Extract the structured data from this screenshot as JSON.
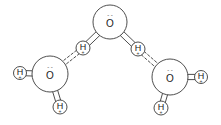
{
  "colors": {
    "stroke": "#3a3a3a",
    "fill": "#ffffff",
    "text": "#222222"
  },
  "atoms": [
    {
      "id": "O1",
      "element": "O",
      "label": "O",
      "charge_mark": "- -",
      "cx": 110,
      "cy": 22,
      "r": 17
    },
    {
      "id": "O2",
      "element": "O",
      "label": "O",
      "charge_mark": "- -",
      "cx": 50,
      "cy": 74,
      "r": 18
    },
    {
      "id": "O3",
      "element": "O",
      "label": "O",
      "charge_mark": "- -",
      "cx": 170,
      "cy": 77,
      "r": 18
    },
    {
      "id": "H1",
      "element": "H",
      "label": "H",
      "charge_mark": "+",
      "cx": 83,
      "cy": 48,
      "r": 7
    },
    {
      "id": "H2",
      "element": "H",
      "label": "H",
      "charge_mark": "+",
      "cx": 138,
      "cy": 49,
      "r": 7
    },
    {
      "id": "H3",
      "element": "H",
      "label": "H",
      "charge_mark": "+",
      "cx": 20,
      "cy": 73,
      "r": 6.5
    },
    {
      "id": "H4",
      "element": "H",
      "label": "H",
      "charge_mark": "+",
      "cx": 60,
      "cy": 107,
      "r": 7
    },
    {
      "id": "H5",
      "element": "H",
      "label": "H",
      "charge_mark": "+",
      "cx": 201,
      "cy": 77,
      "r": 6.5
    },
    {
      "id": "H6",
      "element": "H",
      "label": "H",
      "charge_mark": "+",
      "cx": 161,
      "cy": 108,
      "r": 7
    }
  ],
  "bonds": [
    {
      "from": "O1",
      "to": "H1",
      "type": "covalent"
    },
    {
      "from": "O1",
      "to": "H2",
      "type": "covalent"
    },
    {
      "from": "O2",
      "to": "H3",
      "type": "covalent"
    },
    {
      "from": "O2",
      "to": "H4",
      "type": "covalent"
    },
    {
      "from": "O3",
      "to": "H5",
      "type": "covalent"
    },
    {
      "from": "O3",
      "to": "H6",
      "type": "covalent"
    },
    {
      "from": "H1",
      "to": "O2",
      "type": "hydrogen"
    },
    {
      "from": "H2",
      "to": "O3",
      "type": "hydrogen"
    }
  ]
}
